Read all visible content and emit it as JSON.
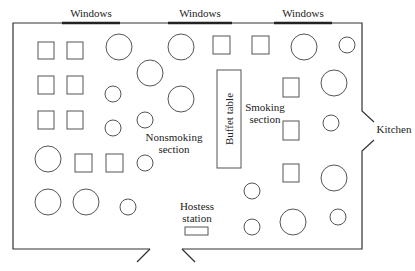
{
  "diagram": {
    "type": "restaurant-floor-plan",
    "labels": {
      "windows": [
        "Windows",
        "Windows",
        "Windows"
      ],
      "kitchen": "Kitchen",
      "buffet": "Buffet table",
      "nonsmoking_line1": "Nonsmoking",
      "nonsmoking_line2": "section",
      "smoking_line1": "Smoking",
      "smoking_line2": "section",
      "hostess_line1": "Hostess",
      "hostess_line2": "station"
    },
    "colors": {
      "line": "#555555",
      "wall": "#333333",
      "background": "#ffffff"
    },
    "tables": {
      "square_count": 14,
      "round_large_count": 11,
      "round_small_count": 10
    }
  }
}
